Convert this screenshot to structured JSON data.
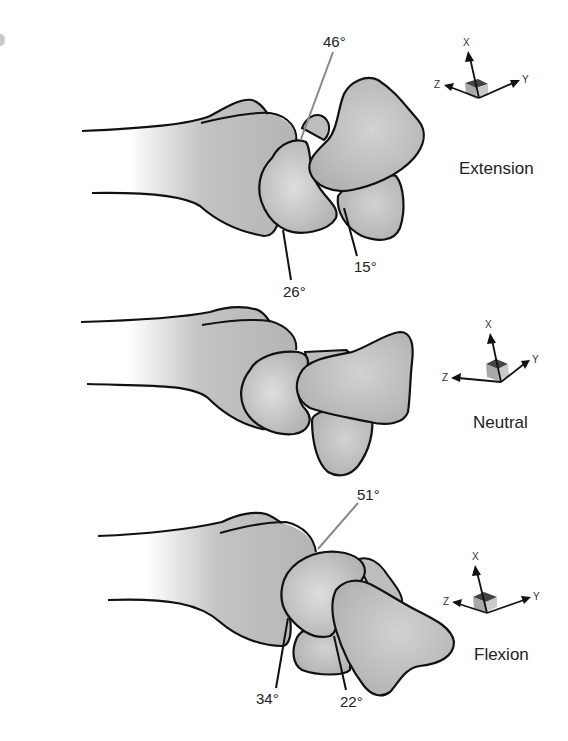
{
  "figure": {
    "type": "anatomical-diagram",
    "colors": {
      "bone_fill": "#b9b9b9",
      "bone_highlight": "#dcdcdc",
      "outline": "#111111",
      "leader_gray": "#888888",
      "leader_dark": "#111111",
      "axis_box": "#8f8f8f"
    }
  },
  "panels": [
    {
      "name": "extension",
      "label": "Extension",
      "angles": [
        {
          "id": "a1",
          "value": "46°"
        },
        {
          "id": "a2",
          "value": "26°"
        },
        {
          "id": "a3",
          "value": "15°"
        }
      ],
      "axes": {
        "x": "X",
        "y": "Y",
        "z": "Z"
      }
    },
    {
      "name": "neutral",
      "label": "Neutral",
      "angles": [],
      "axes": {
        "x": "X",
        "y": "Y",
        "z": "Z"
      }
    },
    {
      "name": "flexion",
      "label": "Flexion",
      "angles": [
        {
          "id": "a1",
          "value": "51°"
        },
        {
          "id": "a2",
          "value": "34°"
        },
        {
          "id": "a3",
          "value": "22°"
        }
      ],
      "axes": {
        "x": "X",
        "y": "Y",
        "z": "Z"
      }
    }
  ]
}
